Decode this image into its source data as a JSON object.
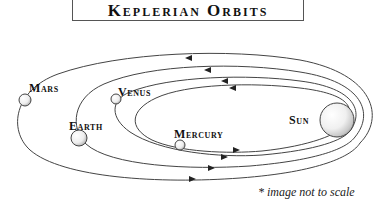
{
  "title": "Keplerian Orbits",
  "labels": {
    "mars": "Mars",
    "venus": "Venus",
    "earth": "Earth",
    "mercury": "Mercury",
    "sun": "Sun"
  },
  "footnote": "* image not to scale",
  "bodies": [
    {
      "name": "Sun",
      "cx": 337,
      "cy": 120,
      "r": 17
    },
    {
      "name": "Mercury",
      "cx": 180,
      "cy": 145,
      "r": 5
    },
    {
      "name": "Venus",
      "cx": 116,
      "cy": 99,
      "r": 5
    },
    {
      "name": "Earth",
      "cx": 79,
      "cy": 138,
      "r": 8
    },
    {
      "name": "Mars",
      "cx": 25,
      "cy": 100,
      "r": 6
    }
  ],
  "colors": {
    "line": "#444444",
    "text": "#111111",
    "planet_fill": "#f2f2f2"
  }
}
